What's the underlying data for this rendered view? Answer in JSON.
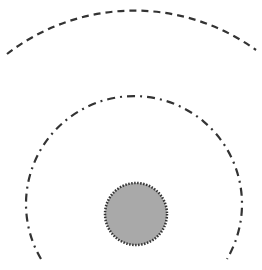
{
  "diagram": {
    "center": {
      "x": 135,
      "y": 222
    },
    "colors": {
      "stroke": "#333333",
      "fill": "#a9a9a9",
      "background": "#ffffff"
    },
    "core_circle": {
      "cx": 136,
      "cy": 214,
      "r": 31,
      "border_style": "dotted"
    },
    "inner_arc": {
      "r": 108,
      "style": "dash-dot"
    },
    "outer_arc": {
      "r": 208,
      "style": "dashed"
    }
  }
}
